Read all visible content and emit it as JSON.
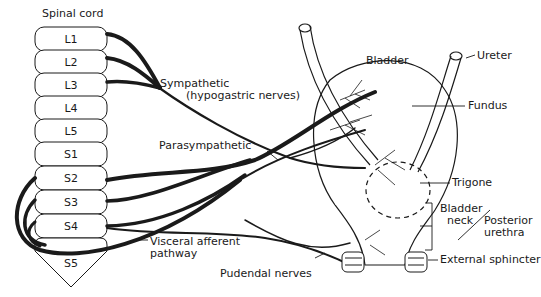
{
  "diagram": {
    "spinal_cord": {
      "label": "Spinal cord",
      "segments": [
        "L1",
        "L2",
        "L3",
        "L4",
        "L5",
        "S1",
        "S2",
        "S3",
        "S4",
        "S5"
      ]
    },
    "labels": {
      "sympathetic_line1": "Sympathetic",
      "sympathetic_line2": "(hypogastric nerves)",
      "parasympathetic": "Parasympathetic",
      "visceral_line1": "Visceral afferent",
      "visceral_line2": "pathway",
      "pudendal": "Pudendal nerves",
      "bladder": "Bladder",
      "ureter": "Ureter",
      "fundus": "Fundus",
      "trigone": "Trigone",
      "bladder_neck_line1": "Bladder",
      "bladder_neck_line2": "neck",
      "posterior_urethra_line1": "Posterior",
      "posterior_urethra_line2": "urethra",
      "external_sphincter": "External sphincter"
    },
    "colors": {
      "ink": "#1a1a1a",
      "background": "#ffffff"
    }
  }
}
